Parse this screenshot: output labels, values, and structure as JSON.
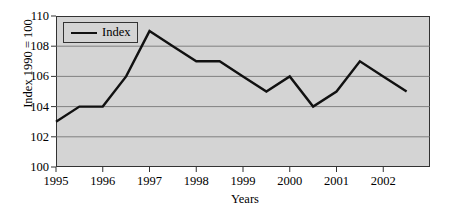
{
  "chart_data": {
    "type": "line",
    "title": "",
    "xlabel": "Years",
    "ylabel": "Index 1990 = 100",
    "xlim": [
      1995,
      2003
    ],
    "ylim": [
      100,
      110
    ],
    "grid": true,
    "grid_axis": "y",
    "legend_position": "top-left",
    "x_tick_labels": [
      "1995",
      "1996",
      "1997",
      "1998",
      "1999",
      "2000",
      "2001",
      "2002"
    ],
    "x_tick_values": [
      1995,
      1996,
      1997,
      1998,
      1999,
      2000,
      2001,
      2002
    ],
    "y_tick_labels": [
      "100",
      "102",
      "104",
      "106",
      "108",
      "110"
    ],
    "y_tick_values": [
      100,
      102,
      104,
      106,
      108,
      110
    ],
    "series": [
      {
        "name": "Index",
        "color": "#111111",
        "x": [
          1995.0,
          1995.5,
          1996.0,
          1996.5,
          1997.0,
          1997.5,
          1998.0,
          1998.5,
          1999.0,
          1999.5,
          2000.0,
          2000.5,
          2001.0,
          2001.5,
          2002.0,
          2002.5
        ],
        "values": [
          103,
          104,
          104,
          106,
          109,
          108,
          107,
          107,
          106,
          105,
          106,
          104,
          105,
          107,
          106,
          105
        ]
      }
    ]
  },
  "legend": {
    "entries": [
      {
        "label": "Index",
        "swatch": "line-swatch"
      }
    ]
  },
  "axes": {
    "y_title": "Index 1990 = 100",
    "x_title": "Years"
  },
  "colors": {
    "plot_background": "#d4d4d4",
    "page_background": "#ffffff",
    "frame": "#333333",
    "gridline": "#6b6b6b",
    "line": "#111111",
    "text": "#000000"
  }
}
